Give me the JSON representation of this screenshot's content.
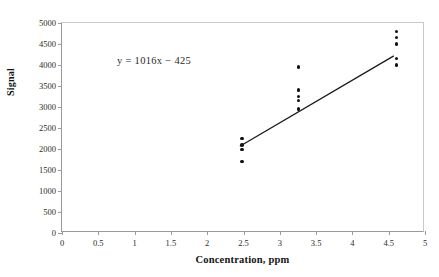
{
  "chart_data": {
    "type": "scatter",
    "title": "",
    "xlabel": "Concentration, ppm",
    "ylabel": "Signal",
    "xlim": [
      0,
      5
    ],
    "ylim": [
      0,
      5000
    ],
    "xticks": [
      "0",
      "0.5",
      "1",
      "1.5",
      "2",
      "2.5",
      "3",
      "3.5",
      "4",
      "4.5",
      "5"
    ],
    "xtick_values": [
      0,
      0.5,
      1,
      1.5,
      2,
      2.5,
      3,
      3.5,
      4,
      4.5,
      5
    ],
    "yticks": [
      "0",
      "500",
      "1000",
      "1500",
      "2000",
      "2500",
      "3000",
      "3500",
      "4000",
      "4500",
      "5000"
    ],
    "ytick_values": [
      0,
      500,
      1000,
      1500,
      2000,
      2500,
      3000,
      3500,
      4000,
      4500,
      5000
    ],
    "grid": false,
    "legend": false,
    "annotation": "y = 1016x − 425",
    "marker_color": "#101010",
    "line_color": "#1a1a1a",
    "fit_line": {
      "slope": 1016,
      "intercept": -425,
      "x_start": 2.45,
      "x_end": 4.57,
      "y_start": 2064,
      "y_end": 4218
    },
    "points": [
      {
        "x": 2.48,
        "y": 2250
      },
      {
        "x": 2.48,
        "y": 2090
      },
      {
        "x": 2.48,
        "y": 1990
      },
      {
        "x": 2.48,
        "y": 1700
      },
      {
        "x": 3.26,
        "y": 3950
      },
      {
        "x": 3.26,
        "y": 3400
      },
      {
        "x": 3.26,
        "y": 3250
      },
      {
        "x": 3.26,
        "y": 3150
      },
      {
        "x": 3.26,
        "y": 2950
      },
      {
        "x": 4.61,
        "y": 4800
      },
      {
        "x": 4.61,
        "y": 4650
      },
      {
        "x": 4.61,
        "y": 4500
      },
      {
        "x": 4.61,
        "y": 4150
      },
      {
        "x": 4.61,
        "y": 4000
      }
    ],
    "clusters": [
      {
        "concentration": 2.48,
        "signals": [
          2250,
          2090,
          1990,
          1700
        ]
      },
      {
        "concentration": 3.26,
        "signals": [
          3950,
          3400,
          3250,
          3150,
          2950
        ]
      },
      {
        "concentration": 4.61,
        "signals": [
          4800,
          4650,
          4500,
          4150,
          4000
        ]
      }
    ]
  }
}
